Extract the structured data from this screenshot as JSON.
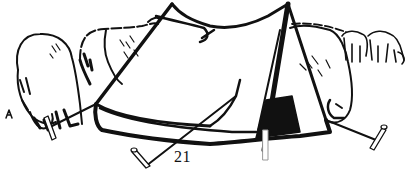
{
  "page": {
    "page_number": "21",
    "illustration": {
      "subject": "pup tent pitched among grazing sheep",
      "elements": [
        "tent",
        "tent-pole",
        "guy-ropes",
        "tent-pegs",
        "sheep-left",
        "sheep-middle",
        "sheep-right",
        "sheep-background"
      ]
    }
  },
  "colors": {
    "ink": "#111111",
    "paper": "#ffffff"
  }
}
